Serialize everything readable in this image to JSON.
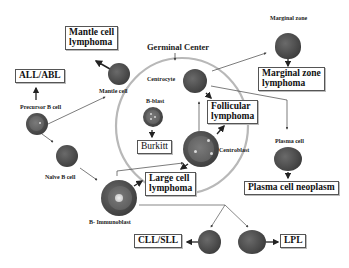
{
  "diagram": {
    "region_label": "Germinal Center",
    "cells": {
      "precursor_b": "Precursor B cell",
      "mantle": "Mantle cell",
      "naive_b": "Naïve B cell",
      "b_immunoblast": "B- Immunoblast",
      "b_blast": "B-blast",
      "centrocyte": "Centrocyte",
      "centroblast": "Centroblast",
      "marginal_zone": "Marginal zone",
      "plasma_cell": "Plasma cell"
    },
    "lymphomas": {
      "all_abl": "ALL/ABL",
      "mantle_cell_l1": "Mantle cell",
      "mantle_cell_l2": "lymphoma",
      "burkitt": "Burkitt",
      "follicular_l1": "Follicular",
      "follicular_l2": "lymphoma",
      "large_cell_l1": "Large cell",
      "large_cell_l2": "lymphoma",
      "marginal_zone_l1": "Marginal zone",
      "marginal_zone_l2": "lymphoma",
      "plasma_cell_neoplasm": "Plasma cell neoplasm",
      "cll_sll": "CLL/SLL",
      "lpl": "LPL"
    },
    "colors": {
      "cell_dark": "#3e3e3e",
      "germinal_center_ring": "#b8b8b8",
      "box_border": "#555555",
      "arrow": "#222222"
    }
  }
}
